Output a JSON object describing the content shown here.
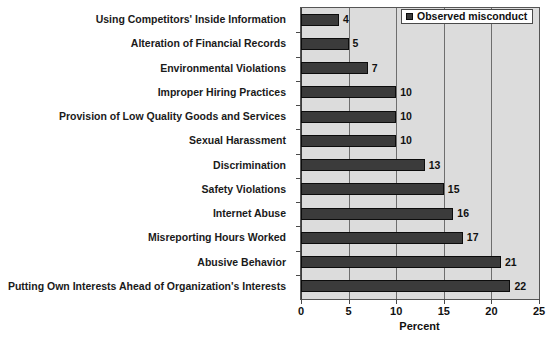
{
  "chart_data": {
    "type": "bar",
    "orientation": "horizontal",
    "title": "",
    "xlabel": "Percent",
    "ylabel": "",
    "xlim": [
      0,
      25
    ],
    "xticks": [
      0,
      5,
      10,
      15,
      20,
      25
    ],
    "xtick_labels": [
      "0",
      "5",
      "10",
      "15",
      "20",
      "25"
    ],
    "grid": true,
    "grid_axis": "x",
    "legend": {
      "position": "top-right",
      "entries": [
        {
          "label": "Observed misconduct",
          "color": "#3b3b3b"
        }
      ]
    },
    "categories": [
      "Using Competitors' Inside Information",
      "Alteration of Financial Records",
      "Environmental Violations",
      "Improper Hiring Practices",
      "Provision of Low Quality Goods and Services",
      "Sexual Harassment",
      "Discrimination",
      "Safety Violations",
      "Internet Abuse",
      "Misreporting Hours Worked",
      "Abusive Behavior",
      "Putting Own Interests Ahead of Organization's Interests"
    ],
    "series": [
      {
        "name": "Observed misconduct",
        "values": [
          4,
          5,
          7,
          10,
          10,
          10,
          13,
          15,
          16,
          17,
          21,
          22
        ],
        "value_labels": [
          "4",
          "5",
          "7",
          "10",
          "10",
          "10",
          "13",
          "15",
          "16",
          "17",
          "21",
          "22"
        ]
      }
    ],
    "colors": {
      "bar_fill": "#3b3b3b",
      "bar_edge": "#0c0c0c",
      "plot_background": "#dcdcdc",
      "gridline": "#6e6e6e",
      "axis": "#4a4a4a",
      "text": "#111111",
      "legend_background": "#ffffff"
    }
  }
}
